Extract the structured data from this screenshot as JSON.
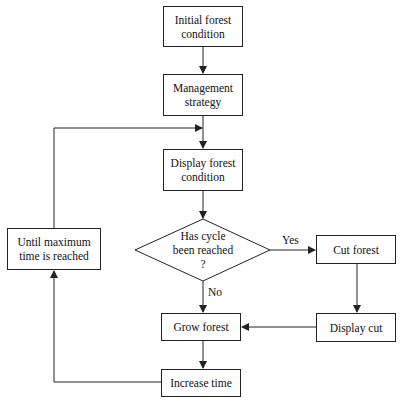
{
  "diagram": {
    "type": "flowchart",
    "nodes": {
      "initial": "Initial forest\ncondition",
      "initial_l1": "Initial forest",
      "initial_l2": "condition",
      "management_l1": "Management",
      "management_l2": "strategy",
      "display_forest_l1": "Display forest",
      "display_forest_l2": "condition",
      "decision_l1": "Has cycle",
      "decision_l2": "been reached",
      "decision_l3": "?",
      "cut_forest": "Cut forest",
      "display_cut": "Display cut",
      "grow_forest": "Grow forest",
      "increase_time": "Increase time",
      "until_l1": "Until maximum",
      "until_l2": "time is reached"
    },
    "edge_labels": {
      "yes": "Yes",
      "no": "No"
    },
    "colors": {
      "line": "#222222",
      "background": "#ffffff"
    }
  }
}
